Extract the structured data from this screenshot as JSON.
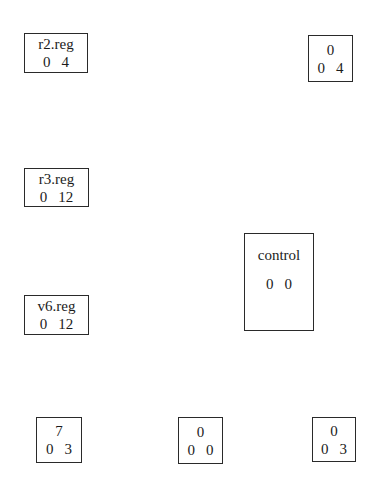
{
  "figure": {
    "background_color": "#ffffff",
    "line_color": "#2a2a2a",
    "text_color": "#1b1b1b"
  },
  "boxes": [
    {
      "name": "r2-reg",
      "title": "r2.reg",
      "left_value": "0",
      "right_value": "4"
    },
    {
      "name": "place-0-4",
      "title": "0",
      "left_value": "0",
      "right_value": "4"
    },
    {
      "name": "r3-reg",
      "title": "r3.reg",
      "left_value": "0",
      "right_value": "12"
    },
    {
      "name": "control",
      "title": "control",
      "left_value": "0",
      "right_value": "0"
    },
    {
      "name": "v6-reg",
      "title": "v6.reg",
      "left_value": "0",
      "right_value": "12"
    },
    {
      "name": "place-7-0-3",
      "title": "7",
      "left_value": "0",
      "right_value": "3"
    },
    {
      "name": "place-0-0-0",
      "title": "0",
      "left_value": "0",
      "right_value": "0"
    },
    {
      "name": "place-0-0-3",
      "title": "0",
      "left_value": "0",
      "right_value": "3"
    }
  ]
}
